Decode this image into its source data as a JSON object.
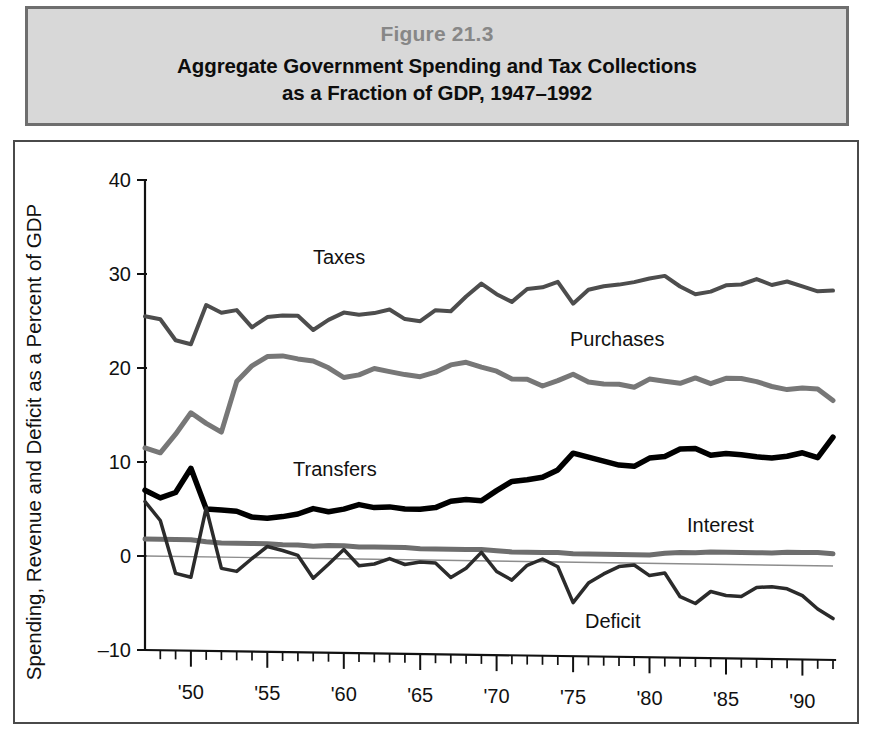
{
  "header": {
    "figure_number": "Figure 21.3",
    "title_line_1": "Aggregate Government Spending and Tax Collections",
    "title_line_2": "as a Fraction of GDP, 1947–1992"
  },
  "axes": {
    "ylabel": "Spending, Revenue and Deficit as a Percent of GDP",
    "y_ticks": [
      "40",
      "30",
      "20",
      "10",
      "0",
      "–10"
    ],
    "x_ticks": [
      "'50",
      "'55",
      "'60",
      "'65",
      "'70",
      "'75",
      "'80",
      "'85",
      "'90"
    ]
  },
  "series_labels": {
    "taxes": "Taxes",
    "purchases": "Purchases",
    "transfers": "Transfers",
    "interest": "Interest",
    "deficit": "Deficit"
  },
  "colors": {
    "taxes": "#4d4d4d",
    "purchases": "#777777",
    "transfers": "#000000",
    "interest": "#6e6e6e",
    "deficit": "#2b2b2b",
    "axis": "#111111",
    "zero_line": "#8d8d8d",
    "panel_bg": "#d8d8d8",
    "panel_border": "#6e6e6e",
    "figure_number": "#878787"
  },
  "chart_data": {
    "type": "line",
    "title": "Aggregate Government Spending and Tax Collections as a Fraction of GDP, 1947–1992",
    "xlabel": "",
    "ylabel": "Spending, Revenue and Deficit as a Percent of GDP",
    "xlim": [
      1947,
      1992
    ],
    "ylim": [
      -10,
      40
    ],
    "y_ticks": [
      -10,
      0,
      10,
      20,
      30,
      40
    ],
    "x_ticks": [
      1950,
      1955,
      1960,
      1965,
      1970,
      1975,
      1980,
      1985,
      1990
    ],
    "x_minor_tick_interval": 1,
    "grid": false,
    "legend": "inline-annotations",
    "x": [
      1947,
      1948,
      1949,
      1950,
      1951,
      1952,
      1953,
      1954,
      1955,
      1956,
      1957,
      1958,
      1959,
      1960,
      1961,
      1962,
      1963,
      1964,
      1965,
      1966,
      1967,
      1968,
      1969,
      1970,
      1971,
      1972,
      1973,
      1974,
      1975,
      1976,
      1977,
      1978,
      1979,
      1980,
      1981,
      1982,
      1983,
      1984,
      1985,
      1986,
      1987,
      1988,
      1989,
      1990,
      1991,
      1992
    ],
    "series": [
      {
        "name": "Taxes",
        "color": "#4d4d4d",
        "line_width": 4,
        "values": [
          25.5,
          25.2,
          23.0,
          22.6,
          26.8,
          26.0,
          26.3,
          24.5,
          25.6,
          25.8,
          25.8,
          24.3,
          25.4,
          26.2,
          26.0,
          26.2,
          26.6,
          25.6,
          25.4,
          26.6,
          26.5,
          28.1,
          29.5,
          28.4,
          27.6,
          29.0,
          29.2,
          29.8,
          27.5,
          29.0,
          29.4,
          29.6,
          29.9,
          30.3,
          30.6,
          29.5,
          28.7,
          29.0,
          29.7,
          29.8,
          30.4,
          29.8,
          30.2,
          29.7,
          29.2,
          29.3
        ]
      },
      {
        "name": "Purchases",
        "color": "#777777",
        "line_width": 5,
        "values": [
          11.5,
          11.0,
          13.0,
          15.3,
          14.2,
          13.3,
          18.7,
          20.4,
          21.4,
          21.5,
          21.2,
          21.0,
          20.3,
          19.3,
          19.6,
          20.3,
          20.0,
          19.7,
          19.5,
          20.0,
          20.8,
          21.1,
          20.6,
          20.2,
          19.4,
          19.4,
          18.7,
          19.3,
          20.0,
          19.2,
          19.0,
          19.0,
          18.7,
          19.6,
          19.4,
          19.2,
          19.8,
          19.2,
          19.8,
          19.8,
          19.5,
          19.0,
          18.7,
          18.9,
          18.8,
          17.6
        ]
      },
      {
        "name": "Transfers",
        "color": "#000000",
        "line_width": 5.5,
        "values": [
          7.0,
          6.2,
          6.8,
          9.4,
          5.1,
          5.0,
          4.9,
          4.3,
          4.2,
          4.4,
          4.7,
          5.3,
          5.0,
          5.3,
          5.8,
          5.5,
          5.6,
          5.4,
          5.4,
          5.6,
          6.3,
          6.5,
          6.4,
          7.5,
          8.5,
          8.7,
          9.0,
          9.8,
          11.6,
          11.2,
          10.8,
          10.4,
          10.3,
          11.2,
          11.4,
          12.2,
          12.3,
          11.6,
          11.8,
          11.7,
          11.5,
          11.4,
          11.6,
          12.0,
          11.5,
          13.7
        ]
      },
      {
        "name": "Interest",
        "color": "#6e6e6e",
        "line_width": 5,
        "values": [
          1.8,
          1.8,
          1.8,
          1.8,
          1.6,
          1.5,
          1.5,
          1.5,
          1.5,
          1.4,
          1.4,
          1.3,
          1.4,
          1.4,
          1.3,
          1.3,
          1.3,
          1.3,
          1.2,
          1.2,
          1.2,
          1.2,
          1.2,
          1.1,
          1.0,
          1.0,
          1.0,
          1.0,
          0.9,
          0.9,
          0.9,
          0.9,
          0.9,
          0.9,
          1.1,
          1.2,
          1.2,
          1.3,
          1.3,
          1.3,
          1.3,
          1.3,
          1.4,
          1.4,
          1.4,
          1.3
        ]
      },
      {
        "name": "Deficit",
        "color": "#2b2b2b",
        "line_width": 3.5,
        "values": [
          5.8,
          3.8,
          -1.8,
          -2.2,
          5.2,
          -1.2,
          -1.5,
          -0.1,
          1.2,
          0.8,
          0.3,
          -2.1,
          -0.6,
          1.0,
          -0.7,
          -0.5,
          0.1,
          -0.5,
          -0.2,
          -0.3,
          -1.8,
          -0.8,
          0.9,
          -1.1,
          -2.0,
          -0.4,
          0.3,
          -0.5,
          -4.3,
          -2.2,
          -1.2,
          -0.4,
          -0.2,
          -1.3,
          -1.0,
          -3.5,
          -4.2,
          -2.9,
          -3.3,
          -3.4,
          -2.4,
          -2.3,
          -2.5,
          -3.2,
          -4.6,
          -5.6
        ]
      }
    ]
  }
}
